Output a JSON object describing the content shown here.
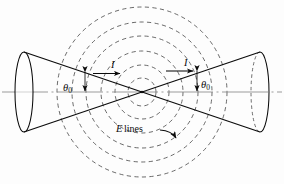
{
  "figure": {
    "kind": "biconical-antenna-field-diagram",
    "background_color": "#fdfdfd",
    "ink_color": "#0b0b0b",
    "axis_color": "#8a8a8a"
  },
  "labels": {
    "theta_left": "θ",
    "theta_left_sub": "0",
    "theta_right": "θ",
    "theta_right_sub": "0",
    "current_left": "I",
    "current_right": "I",
    "elines_symbol": "E",
    "elines_text": "lines"
  },
  "geometry": {
    "apex_x": 142,
    "apex_y": 92,
    "axis_y": 92,
    "axis_x_start": 2,
    "axis_x_end": 282,
    "left_cone_base_x": 24,
    "left_cone_base_rx": 9,
    "left_cone_base_ry": 40,
    "right_cone_base_x": 260,
    "right_cone_base_rx": 9,
    "right_cone_base_ry": 40,
    "half_angle_degrees": 22
  },
  "field_circles": {
    "center_x": 142,
    "center_y": 92,
    "count": 6,
    "radii": [
      14,
      27,
      41,
      56,
      70,
      85
    ],
    "style": "dashed",
    "meaning": "E lines"
  }
}
